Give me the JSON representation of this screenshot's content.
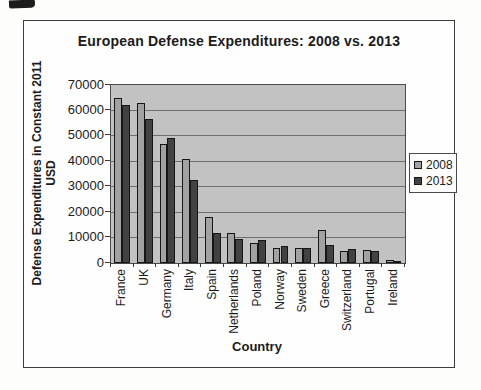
{
  "chart_data": {
    "type": "bar",
    "title": "European Defense Expenditures: 2008 vs. 2013",
    "xlabel": "Country",
    "ylabel": "Defense Expenditures in Constant 2011 USD",
    "ylabel_lines": [
      "Defense Expenditures in Constant 2011",
      "USD"
    ],
    "categories": [
      "France",
      "UK",
      "Germany",
      "Italy",
      "Spain",
      "Netherlands",
      "Poland",
      "Norway",
      "Sweden",
      "Greece",
      "Switzerland",
      "Portugal",
      "Ireland"
    ],
    "series": [
      {
        "name": "2008",
        "color": "#a2a2a2",
        "values": [
          65000,
          63000,
          47000,
          41000,
          18000,
          12000,
          8000,
          6000,
          6000,
          13000,
          4800,
          5000,
          1000
        ]
      },
      {
        "name": "2013",
        "color": "#424242",
        "values": [
          62000,
          56500,
          49000,
          32500,
          12000,
          9500,
          9200,
          6700,
          6000,
          7000,
          5500,
          4700,
          900
        ]
      }
    ],
    "ylim": [
      0,
      70000
    ],
    "ytick_step": 10000,
    "ytick_labels": [
      "0",
      "10000",
      "20000",
      "30000",
      "40000",
      "50000",
      "60000",
      "70000"
    ],
    "grid": true,
    "legend_position": "right",
    "plot_bg_color": "#c2c2c2",
    "gridline_color": "#6f6f6f"
  }
}
